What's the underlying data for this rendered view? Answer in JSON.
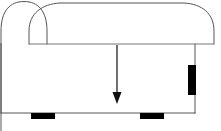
{
  "figure": {
    "type": "line-drawing",
    "canvas": {
      "width": 221,
      "height": 131,
      "background": "#ffffff"
    },
    "colors": {
      "outline": "#555555",
      "seam": "#777777",
      "arrow": "#111111",
      "foot": "#000000",
      "tab": "#000000",
      "background": "#ffffff"
    },
    "stroke_widths": {
      "outline": 1,
      "seam": 1,
      "arrow_shaft": 1.2
    },
    "parts": [
      {
        "name": "outer-back-outline",
        "label": "Outer back outline",
        "shape": "arched-outline",
        "path": "M 1 131 L 1 44 L 1 30 C 1 10 10 1 24 1 C 38 1 47 10 47 30 L 47 44"
      },
      {
        "name": "backrest-arch",
        "label": "Backrest arch",
        "shape": "arched-outline",
        "path": "M 29 44 L 29 30 C 29 12 42 3 60 2 L 184 2 C 203 3 214 12 214 30 L 214 44"
      },
      {
        "name": "seat-seam-line",
        "label": "Seat seam line",
        "shape": "horizontal-line",
        "y": 44,
        "x1": 29,
        "x2": 214
      },
      {
        "name": "left-body-edge",
        "label": "Left body edge",
        "shape": "vertical-line",
        "x": 1,
        "y1": 44,
        "y2": 113
      },
      {
        "name": "right-body-edge",
        "label": "Right body edge",
        "shape": "vertical-line",
        "x": 195,
        "y1": 44,
        "y2": 113
      },
      {
        "name": "base-line",
        "label": "Base line",
        "shape": "horizontal-line",
        "y": 113,
        "x1": 1,
        "x2": 195
      }
    ],
    "arrow": {
      "name": "direction-arrow",
      "label": "Downward direction arrow",
      "direction": "down",
      "shaft": {
        "x": 117,
        "y1": 45,
        "y2": 95
      },
      "head": {
        "tip_x": 117,
        "tip_y": 104,
        "half_width": 4.5,
        "base_y": 92
      },
      "color": "#111111"
    },
    "feet": [
      {
        "name": "foot-left",
        "label": "Left foot",
        "x": 31,
        "y": 113,
        "width": 24,
        "height": 6
      },
      {
        "name": "foot-right",
        "label": "Right foot",
        "x": 140,
        "y": 113,
        "width": 24,
        "height": 6
      }
    ],
    "side_tab": {
      "name": "side-tab",
      "label": "Right side tab",
      "x": 188,
      "y": 65,
      "width": 8,
      "height": 30,
      "color": "#000000"
    }
  }
}
